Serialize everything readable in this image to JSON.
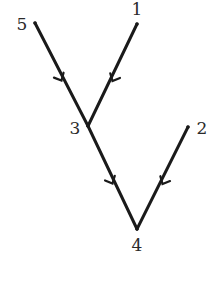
{
  "diagram": {
    "type": "directed-tree",
    "nodes": [
      {
        "id": "1",
        "label": "1",
        "x": 137,
        "y": 24,
        "label_x": 137,
        "label_y": 15
      },
      {
        "id": "2",
        "label": "2",
        "x": 188,
        "y": 127,
        "label_x": 202,
        "label_y": 134
      },
      {
        "id": "3",
        "label": "3",
        "x": 88,
        "y": 126,
        "label_x": 75,
        "label_y": 134
      },
      {
        "id": "4",
        "label": "4",
        "x": 137,
        "y": 229,
        "label_x": 137,
        "label_y": 251
      },
      {
        "id": "5",
        "label": "5",
        "x": 35,
        "y": 23,
        "label_x": 22,
        "label_y": 30
      }
    ],
    "edges": [
      {
        "from": "5",
        "to": "3"
      },
      {
        "from": "1",
        "to": "3"
      },
      {
        "from": "3",
        "to": "4"
      },
      {
        "from": "2",
        "to": "4"
      }
    ],
    "colors": {
      "edge": "#1a1a1a",
      "label": "#2a2a2a",
      "background": "#ffffff"
    }
  }
}
